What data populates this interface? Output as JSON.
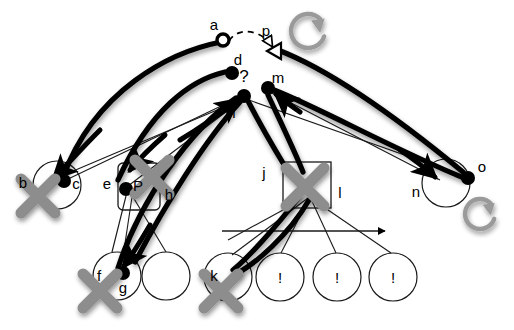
{
  "canvas": {
    "width": 514,
    "height": 330,
    "background": "#ffffff"
  },
  "palette": {
    "ink": "#000000",
    "gray_mark": "#8d8d8d",
    "gray_icon": "#9a9a9a",
    "thin_line": "#1a1a1a",
    "paper": "#ffffff"
  },
  "labels": {
    "a": "a",
    "b": "b",
    "c": "c",
    "d": "d",
    "e": "e",
    "f": "f",
    "g": "g",
    "h": "h",
    "i": "i",
    "j": "j",
    "k": "k",
    "l": "l",
    "m": "m",
    "n": "n",
    "o": "o",
    "p": "p",
    "P": "P",
    "question": "?",
    "bang1": "!",
    "bang2": "!",
    "bang3": "!",
    "bang_k": "!"
  },
  "nodes": [
    {
      "id": "a",
      "label": "a",
      "kind": "ring",
      "x": 223,
      "y": 40,
      "r": 6,
      "label_dx": -9,
      "label_dy": -10
    },
    {
      "id": "d",
      "label": "d",
      "kind": "filled",
      "x": 232,
      "y": 73,
      "r": 7,
      "label_dx": 6,
      "label_dy": -8
    },
    {
      "id": "i",
      "label": "i",
      "kind": "filled",
      "x": 244,
      "y": 96,
      "r": 7,
      "label_dx": -10,
      "label_dy": 22
    },
    {
      "id": "m",
      "label": "m",
      "kind": "filled",
      "x": 268,
      "y": 88,
      "r": 7,
      "label_dx": 10,
      "label_dy": -5
    },
    {
      "id": "c",
      "label": "c",
      "kind": "filled",
      "x": 64,
      "y": 181,
      "r": 7,
      "label_dx": 12,
      "label_dy": 8
    },
    {
      "id": "g",
      "label": "g",
      "kind": "filled",
      "x": 123,
      "y": 273,
      "r": 7,
      "label_dx": 0,
      "label_dy": 20
    },
    {
      "id": "o",
      "label": "o",
      "kind": "filled",
      "x": 468,
      "y": 178,
      "r": 7,
      "label_dx": 14,
      "label_dy": -6
    },
    {
      "id": "eP",
      "label": "P",
      "kind": "filled",
      "x": 126,
      "y": 189,
      "r": 7,
      "label_dx": 12,
      "label_dy": 2
    }
  ],
  "open_circles": [
    {
      "id": "b",
      "label": "b",
      "cx": 57,
      "cy": 185,
      "r": 24,
      "label_dx": -34,
      "label_dy": 3
    },
    {
      "id": "f",
      "label": "f",
      "cx": 117,
      "cy": 276,
      "r": 24,
      "label_dx": -18,
      "label_dy": 5
    },
    {
      "id": "blank",
      "label": "",
      "cx": 166,
      "cy": 276,
      "r": 24,
      "label_dx": 0,
      "label_dy": 0
    },
    {
      "id": "k",
      "label": "k",
      "cx": 228,
      "cy": 277,
      "r": 24,
      "label_dx": -14,
      "label_dy": 4
    },
    {
      "id": "bang1",
      "label": "!",
      "cx": 280,
      "cy": 277,
      "r": 24,
      "label_dx": 0,
      "label_dy": 6
    },
    {
      "id": "bang2",
      "label": "!",
      "cx": 337,
      "cy": 277,
      "r": 24,
      "label_dx": 0,
      "label_dy": 6
    },
    {
      "id": "bang3",
      "label": "!",
      "cx": 393,
      "cy": 277,
      "r": 24,
      "label_dx": 0,
      "label_dy": 6
    },
    {
      "id": "n",
      "label": "n",
      "cx": 446,
      "cy": 183,
      "r": 24,
      "label_dx": -30,
      "label_dy": 14
    }
  ],
  "boxes": [
    {
      "id": "eh_box",
      "label_left": "e",
      "label_right": "h",
      "x": 118,
      "y": 163,
      "w": 42,
      "h": 47,
      "rx": 5
    },
    {
      "id": "l_box",
      "label_left": "",
      "label_right": "l",
      "x": 283,
      "y": 162,
      "w": 48,
      "h": 46,
      "rx": 0
    }
  ],
  "cross_marks": [
    {
      "id": "x_b",
      "cx": 38,
      "cy": 196,
      "size": 34
    },
    {
      "id": "x_eP",
      "cx": 152,
      "cy": 177,
      "size": 34
    },
    {
      "id": "x_f",
      "cx": 100,
      "cy": 291,
      "size": 34
    },
    {
      "id": "x_k",
      "cx": 221,
      "cy": 291,
      "size": 34
    },
    {
      "id": "x_l",
      "cx": 305,
      "cy": 187,
      "size": 38
    }
  ],
  "rotate_icons": [
    {
      "id": "rotate_top",
      "cx": 308,
      "cy": 31,
      "r": 17
    },
    {
      "id": "rotate_bottom",
      "cx": 480,
      "cy": 214,
      "r": 15
    }
  ],
  "markers": {
    "p_arrowhead": {
      "id": "p",
      "label": "p",
      "x": 272,
      "y": 50,
      "label_dx": -6,
      "label_dy": -14
    },
    "j_arrowhead": {
      "id": "j",
      "label": "j",
      "x": 288,
      "y": 172,
      "label_dx": -24,
      "label_dy": 6
    }
  },
  "annotations": {
    "question_mark": {
      "text": "?",
      "x": 244,
      "y": 82
    }
  },
  "edges": {
    "dashed": [
      {
        "id": "a_to_p",
        "d": "M 229 41 C 238 26 262 30 272 46"
      }
    ],
    "thick": [
      {
        "id": "c_to_d",
        "d": "M 63 177 C 95 90 170 52 221 42"
      },
      {
        "id": "eP_to_d",
        "d": "M 118 180 C 150 110 190 80 225 72"
      },
      {
        "id": "g_to_i",
        "d": "M 118 268 C 140 200 190 130 236 98"
      },
      {
        "id": "f_to_i",
        "d": "M 135 262 C 165 205 205 140 240 102"
      },
      {
        "id": "o_to_p",
        "d": "M 463 172 C 400 120 330 70 278 50"
      },
      {
        "id": "o_to_m",
        "d": "M 464 178 C 395 150 320 108 274 90"
      },
      {
        "id": "i_to_j",
        "d": "M 248 101 C 262 128 275 150 286 168"
      },
      {
        "id": "m_to_l",
        "d": "M 268 95 C 282 125 295 152 303 172"
      },
      {
        "id": "l_to_k",
        "d": "M 300 196 C 275 228 248 258 233 270"
      },
      {
        "id": "l_to_k2",
        "d": "M 309 200 C 288 236 255 264 236 274"
      }
    ],
    "thick_arrows_into": [
      {
        "id": "to_b",
        "d": "M 100 130 C 80 150 66 166 54 178"
      },
      {
        "id": "to_e",
        "d": "M 165 135 C 150 148 140 158 130 170"
      },
      {
        "id": "to_f",
        "d": "M 150 225 C 140 242 132 255 124 266"
      },
      {
        "id": "to_n",
        "d": "M 400 150 C 415 160 425 168 435 177"
      },
      {
        "id": "to_i_l",
        "d": "M 180 140 C 205 125 225 110 238 100"
      },
      {
        "id": "to_m_lo",
        "d": "M 300 112 C 290 105 282 99 276 94"
      }
    ],
    "thin": [
      {
        "id": "t_c_i",
        "d": "M 66 180 L 240 97"
      },
      {
        "id": "t_i_b",
        "d": "M 243 99 L 52 180"
      },
      {
        "id": "t_i_eP",
        "d": "M 243 99 L 128 186"
      },
      {
        "id": "t_i_o",
        "d": "M 246 99 L 464 176"
      },
      {
        "id": "t_m_n",
        "d": "M 270 92 L 440 180"
      },
      {
        "id": "t_eP_blank",
        "d": "M 130 192 L 166 252"
      },
      {
        "id": "t_eP_f",
        "d": "M 126 196 L 112 252"
      },
      {
        "id": "t_eP_g",
        "d": "M 132 197 L 124 250"
      },
      {
        "id": "t_l_k",
        "d": "M 308 198 L 232 255"
      },
      {
        "id": "t_l_b1",
        "d": "M 309 199 L 281 253"
      },
      {
        "id": "t_l_b2",
        "d": "M 311 199 L 336 253"
      },
      {
        "id": "t_l_b3",
        "d": "M 312 199 L 391 253"
      },
      {
        "id": "t_lbox_left",
        "d": "M 283 210 L 228 240"
      }
    ],
    "straight_arrow": {
      "id": "baseline_arrow",
      "x1": 222,
      "y1": 231,
      "x2": 385,
      "y2": 231
    }
  }
}
